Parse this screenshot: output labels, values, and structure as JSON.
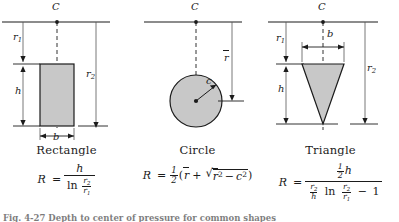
{
  "figure": {
    "caption": "Fig. 4-27  Depth to center of pressure for common shapes",
    "surface_label": "C",
    "panels": [
      {
        "id": "rectangle",
        "name": "Rectangle",
        "labels": {
          "centroid_axis": "C",
          "r1": "r",
          "r1_sub": "1",
          "r2": "r",
          "r2_sub": "2",
          "height": "h",
          "base": "b"
        },
        "formula_text": "R = h / ln(r2/r1)",
        "formula": {
          "lhs": "R",
          "equals": "=",
          "numerator": "h",
          "denominator_op": "ln",
          "den_frac_num": "r",
          "den_frac_num_sub": "2",
          "den_frac_den": "r",
          "den_frac_den_sub": "1"
        }
      },
      {
        "id": "circle",
        "name": "Circle",
        "labels": {
          "centroid_axis": "C",
          "rbar": "r",
          "radius": "c"
        },
        "formula_text": "R = 1/2 ( rbar + sqrt( rbar^2 - c^2 ) )",
        "formula": {
          "lhs": "R",
          "equals": "=",
          "half_num": "1",
          "half_den": "2",
          "open_paren": "(",
          "rbar": "r",
          "plus": "+",
          "radical_sign": "√",
          "rbar2": "r",
          "exp2": "2",
          "minus": "−",
          "c": "c",
          "c_exp": "2",
          "close_paren": ")"
        }
      },
      {
        "id": "triangle",
        "name": "Triangle",
        "labels": {
          "centroid_axis": "C",
          "r1": "r",
          "r1_sub": "1",
          "r2": "r",
          "r2_sub": "2",
          "height": "h",
          "base": "b"
        },
        "formula_text": "R = (1/2)h / [ (r2/h) ln(r2/r1) - 1 ]",
        "formula": {
          "lhs": "R",
          "equals": "=",
          "num_frac_num": "1",
          "num_frac_den": "2",
          "num_var": "h",
          "den_frac1_num": "r",
          "den_frac1_num_sub": "2",
          "den_frac1_den": "h",
          "den_op": "ln",
          "den_frac2_num": "r",
          "den_frac2_num_sub": "2",
          "den_frac2_den": "r",
          "den_frac2_den_sub": "1",
          "den_minus": "−",
          "den_one": "1"
        }
      }
    ],
    "colors": {
      "shape_fill": "#c8c8c8",
      "stroke": "#1b1b1b",
      "thin_stroke": "#555555"
    }
  }
}
